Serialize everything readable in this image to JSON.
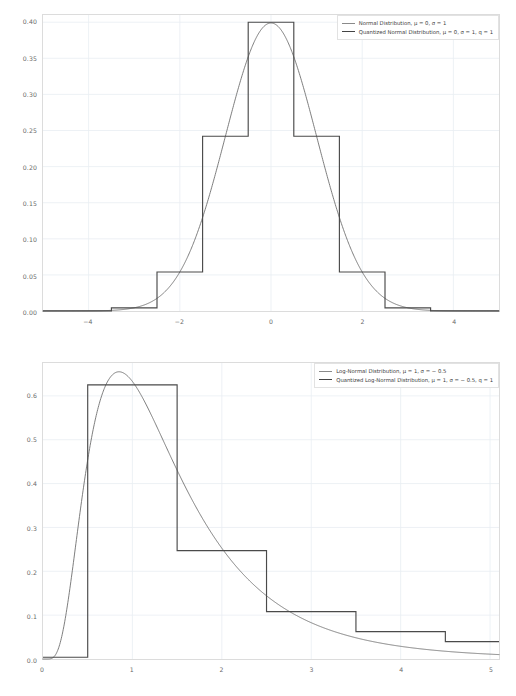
{
  "figure": {
    "panels": [
      "normal",
      "lognormal"
    ],
    "background": "#ffffff",
    "curve_color": "#6f6f6f",
    "step_color": "#4a4a4a",
    "grid_color": "#e9eef2"
  },
  "normal": {
    "legend": {
      "curve_label": "Normal Distribution, μ = 0, σ = 1",
      "step_label": "Quantized Normal Distribution, μ = 0, σ = 1, q = 1"
    },
    "yticks": [
      "0.00",
      "0.05",
      "0.10",
      "0.15",
      "0.20",
      "0.25",
      "0.30",
      "0.35",
      "0.40"
    ],
    "xticks": [
      "−4",
      "−2",
      "0",
      "2",
      "4"
    ]
  },
  "lognormal": {
    "legend": {
      "curve_label": "Log-Normal Distribution, μ = 1, σ = − 0.5",
      "step_label": "Quantized Log-Normal Distribution, μ = 1, σ = − 0.5, q = 1"
    },
    "yticks": [
      "0.0",
      "0.1",
      "0.2",
      "0.3",
      "0.4",
      "0.5",
      "0.6"
    ],
    "xticks": [
      "0",
      "1",
      "2",
      "3",
      "4",
      "5"
    ]
  },
  "chart_data": [
    {
      "type": "line",
      "id": "normal",
      "title": "",
      "xlabel": "",
      "ylabel": "",
      "xlim": [
        -5,
        5
      ],
      "ylim": [
        0,
        0.41
      ],
      "grid": true,
      "legend_position": "upper right",
      "xticks": [
        -4,
        -2,
        0,
        2,
        4
      ],
      "yticks": [
        0.0,
        0.05,
        0.1,
        0.15,
        0.2,
        0.25,
        0.3,
        0.35,
        0.4
      ],
      "series": [
        {
          "name": "Normal Distribution, μ = 0, σ = 1",
          "style": "continuous-pdf",
          "color": "#6f6f6f",
          "params": {
            "mu": 0,
            "sigma": 1
          },
          "peak": {
            "x": 0.0,
            "y": 0.3989
          }
        },
        {
          "name": "Quantized Normal Distribution, μ = 0, σ = 1, q = 1",
          "style": "step",
          "color": "#4a4a4a",
          "params": {
            "mu": 0,
            "sigma": 1,
            "q": 1
          },
          "bin_edges": [
            -5,
            -3.5,
            -2.5,
            -1.5,
            -0.5,
            0.5,
            1.5,
            2.5,
            3.5,
            5
          ],
          "bin_values": [
            0.0002,
            0.0044,
            0.054,
            0.242,
            0.4,
            0.242,
            0.054,
            0.0044,
            0.0002
          ]
        }
      ]
    },
    {
      "type": "line",
      "id": "lognormal",
      "title": "",
      "xlabel": "",
      "ylabel": "",
      "xlim": [
        0,
        5.1
      ],
      "ylim": [
        0,
        0.675
      ],
      "grid": true,
      "legend_position": "upper right",
      "xticks": [
        0,
        1,
        2,
        3,
        4,
        5
      ],
      "yticks": [
        0.0,
        0.1,
        0.2,
        0.3,
        0.4,
        0.5,
        0.6
      ],
      "series": [
        {
          "name": "Log-Normal Distribution, μ = 1, σ = − 0.5",
          "style": "continuous-pdf",
          "color": "#6f6f6f",
          "params": {
            "mu": 1,
            "sigma": -0.5
          },
          "peak": {
            "x": 0.85,
            "y": 0.655
          }
        },
        {
          "name": "Quantized Log-Normal Distribution, μ = 1, σ = − 0.5, q = 1",
          "style": "step",
          "color": "#4a4a4a",
          "params": {
            "mu": 1,
            "sigma": -0.5,
            "q": 1
          },
          "bin_edges": [
            0,
            0.5,
            1.5,
            2.5,
            3.5,
            4.5,
            5.1
          ],
          "bin_values": [
            0.004,
            0.625,
            0.247,
            0.108,
            0.0625,
            0.0395
          ]
        }
      ]
    }
  ]
}
